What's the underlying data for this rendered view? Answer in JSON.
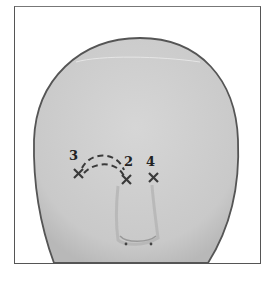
{
  "diagram": {
    "colors": {
      "face_fill": "#cfcfcf",
      "outline": "#555555",
      "marks": "#3a3a3a",
      "frame": "#555555"
    },
    "points": [
      {
        "label": "3",
        "x": 78,
        "y": 173
      },
      {
        "label": "2",
        "x": 127,
        "y": 179
      },
      {
        "label": "4",
        "x": 154,
        "y": 178
      }
    ],
    "connections": [
      {
        "from": "3",
        "to": "2",
        "style": "dashed-arc",
        "count": 2
      }
    ]
  }
}
